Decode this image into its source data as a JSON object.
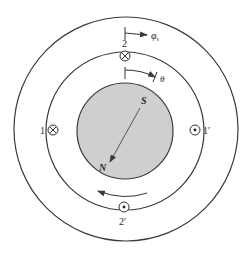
{
  "diagram": {
    "colors": {
      "stroke": "#3a3a3a",
      "rotor_fill": "#cfcfcf",
      "background": "#ffffff"
    },
    "stator_outer": {
      "cx": 126,
      "cy": 129,
      "r": 112
    },
    "stator_inner": {
      "cx": 125,
      "cy": 131,
      "r": 79
    },
    "rotor": {
      "cx": 125,
      "cy": 131,
      "r": 48
    },
    "conductors": [
      {
        "id": "1",
        "label": "1",
        "symbol": "cross",
        "cx": 53,
        "cy": 130,
        "label_x": 43,
        "label_y": 134
      },
      {
        "id": "1p",
        "label": "1′",
        "symbol": "dot",
        "cx": 195,
        "cy": 130,
        "label_x": 206,
        "label_y": 134
      },
      {
        "id": "2",
        "label": "2",
        "symbol": "cross",
        "cx": 125,
        "cy": 56,
        "label_x": 125,
        "label_y": 46
      },
      {
        "id": "2p",
        "label": "2′",
        "symbol": "dot",
        "cx": 125,
        "cy": 207,
        "label_x": 125,
        "label_y": 224
      }
    ],
    "magnet": {
      "south_label": "S",
      "north_label": "N",
      "s_x": 144,
      "s_y": 103,
      "n_x": 104,
      "n_y": 170
    },
    "angles": {
      "phi_s_label": "φ",
      "phi_s_subscript": "s",
      "theta_label": "θ"
    },
    "rotation_direction": "counterclockwise"
  }
}
